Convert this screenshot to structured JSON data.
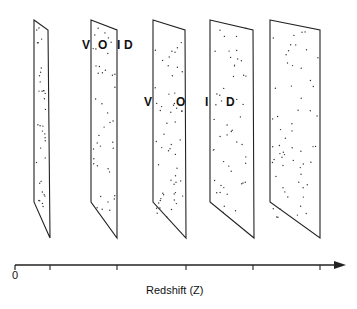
{
  "diagram": {
    "slabs": [
      {
        "id": 1,
        "top": [
          [
            34,
            20
          ],
          [
            48,
            30
          ]
        ],
        "bottom": [
          [
            34,
            202
          ],
          [
            50,
            238
          ]
        ],
        "dots": 35
      },
      {
        "id": 2,
        "top": [
          [
            91,
            20
          ],
          [
            117,
            30
          ]
        ],
        "bottom": [
          [
            91,
            202
          ],
          [
            117,
            238
          ]
        ],
        "dots": 40
      },
      {
        "id": 3,
        "top": [
          [
            153,
            20
          ],
          [
            185,
            30
          ]
        ],
        "bottom": [
          [
            153,
            202
          ],
          [
            186,
            238
          ]
        ],
        "dots": 55
      },
      {
        "id": 4,
        "top": [
          [
            210,
            20
          ],
          [
            253,
            30
          ]
        ],
        "bottom": [
          [
            210,
            202
          ],
          [
            254,
            238
          ]
        ],
        "dots": 50
      },
      {
        "id": 5,
        "top": [
          [
            270,
            20
          ],
          [
            320,
            30
          ]
        ],
        "bottom": [
          [
            270,
            202
          ],
          [
            320,
            238
          ]
        ],
        "dots": 60
      }
    ],
    "void_labels": {
      "upper": [
        {
          "text": "V",
          "x": 82,
          "y": 38
        },
        {
          "text": "O",
          "x": 98,
          "y": 38
        },
        {
          "text": "I",
          "x": 117,
          "y": 38
        },
        {
          "text": "D",
          "x": 124,
          "y": 38
        }
      ],
      "lower": [
        {
          "text": "V",
          "x": 144,
          "y": 95
        },
        {
          "text": "O",
          "x": 176,
          "y": 95
        },
        {
          "text": "I",
          "x": 205,
          "y": 95
        },
        {
          "text": "D",
          "x": 226,
          "y": 95
        }
      ]
    },
    "axis": {
      "origin_label": "0",
      "title": "Redshift (Z)",
      "ticks_x": [
        50,
        117,
        186,
        253,
        320
      ]
    }
  }
}
